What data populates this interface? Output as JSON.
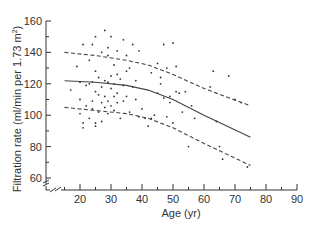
{
  "chart_data": {
    "type": "scatter",
    "title": "",
    "xlabel": "Age (yr)",
    "ylabel": "Filtration rate (ml/min per 1.73 m²)",
    "ylabel_main": "Filtration rate (ml/min per 1.73 m",
    "ylabel_sup": "2",
    "ylabel_end": ")",
    "xlim": [
      13,
      90
    ],
    "ylim": [
      50,
      160
    ],
    "xticks": [
      20,
      30,
      40,
      50,
      60,
      70,
      80,
      90
    ],
    "yticks": [
      60,
      80,
      100,
      120,
      140,
      160
    ],
    "axis_break": true,
    "grid": false,
    "legend": null,
    "points": [
      [
        17,
        116
      ],
      [
        19,
        131
      ],
      [
        20,
        101
      ],
      [
        20,
        110
      ],
      [
        20,
        121
      ],
      [
        21,
        145
      ],
      [
        21,
        92
      ],
      [
        21,
        95
      ],
      [
        22,
        106
      ],
      [
        22,
        119
      ],
      [
        23,
        120
      ],
      [
        23,
        135
      ],
      [
        23,
        98
      ],
      [
        24,
        145
      ],
      [
        24,
        121
      ],
      [
        24,
        109
      ],
      [
        24,
        104
      ],
      [
        25,
        150
      ],
      [
        25,
        128
      ],
      [
        25,
        115
      ],
      [
        25,
        95
      ],
      [
        25,
        93
      ],
      [
        26,
        113
      ],
      [
        26,
        124
      ],
      [
        26,
        102
      ],
      [
        27,
        140
      ],
      [
        27,
        118
      ],
      [
        27,
        108
      ],
      [
        27,
        96
      ],
      [
        28,
        154
      ],
      [
        28,
        122
      ],
      [
        28,
        112
      ],
      [
        28,
        105
      ],
      [
        29,
        143
      ],
      [
        29,
        138
      ],
      [
        29,
        121
      ],
      [
        29,
        109
      ],
      [
        29,
        101
      ],
      [
        30,
        150
      ],
      [
        30,
        125
      ],
      [
        30,
        117
      ],
      [
        30,
        106
      ],
      [
        31,
        132
      ],
      [
        31,
        120
      ],
      [
        31,
        112
      ],
      [
        31,
        103
      ],
      [
        32,
        141
      ],
      [
        32,
        126
      ],
      [
        32,
        114
      ],
      [
        32,
        108
      ],
      [
        33,
        123
      ],
      [
        33,
        98
      ],
      [
        34,
        148
      ],
      [
        34,
        119
      ],
      [
        34,
        109
      ],
      [
        35,
        138
      ],
      [
        35,
        128
      ],
      [
        35,
        112
      ],
      [
        36,
        130
      ],
      [
        36,
        102
      ],
      [
        37,
        145
      ],
      [
        37,
        118
      ],
      [
        38,
        122
      ],
      [
        38,
        110
      ],
      [
        39,
        141
      ],
      [
        39,
        99
      ],
      [
        40,
        104
      ],
      [
        41,
        98
      ],
      [
        42,
        93
      ],
      [
        43,
        127
      ],
      [
        43,
        98
      ],
      [
        44,
        100
      ],
      [
        45,
        133
      ],
      [
        45,
        114
      ],
      [
        46,
        120
      ],
      [
        46,
        124
      ],
      [
        47,
        145
      ],
      [
        47,
        111
      ],
      [
        48,
        130
      ],
      [
        48,
        99
      ],
      [
        49,
        112
      ],
      [
        49,
        108
      ],
      [
        50,
        146
      ],
      [
        50,
        95
      ],
      [
        51,
        131
      ],
      [
        51,
        115
      ],
      [
        52,
        114
      ],
      [
        53,
        102
      ],
      [
        54,
        115
      ],
      [
        55,
        80
      ],
      [
        56,
        106
      ],
      [
        57,
        98
      ],
      [
        62,
        118
      ],
      [
        63,
        128
      ],
      [
        64,
        96
      ],
      [
        65,
        80
      ],
      [
        66,
        72
      ],
      [
        68,
        125
      ],
      [
        70,
        110
      ],
      [
        72,
        108
      ],
      [
        74,
        67
      ]
    ],
    "series": [
      {
        "name": "mean",
        "style": "solid",
        "x": [
          15,
          25,
          35,
          42,
          50,
          60,
          75
        ],
        "y": [
          122,
          121,
          119,
          116,
          110,
          100,
          86
        ]
      },
      {
        "name": "upper",
        "style": "dashed",
        "x": [
          15,
          25,
          35,
          42,
          50,
          60,
          75
        ],
        "y": [
          140,
          138,
          135,
          132,
          126,
          117,
          106
        ]
      },
      {
        "name": "lower",
        "style": "dashed",
        "x": [
          15,
          25,
          35,
          42,
          50,
          60,
          75
        ],
        "y": [
          105,
          103,
          101,
          98,
          92,
          82,
          68
        ]
      }
    ]
  },
  "colors": {
    "axis": "#333333",
    "points": "#333333",
    "lines": "#444444"
  }
}
